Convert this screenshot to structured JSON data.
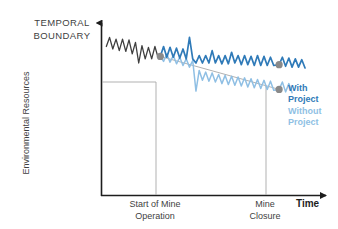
{
  "title": {
    "line1": "TEMPORAL",
    "line2": "BOUNDARY"
  },
  "axes": {
    "ylabel": "Environmental Resources",
    "xlabel": "Time",
    "xticks": [
      {
        "line1": "Start of Mine",
        "line2": "Operation"
      },
      {
        "line1": "Mine",
        "line2": "Closure"
      }
    ]
  },
  "legend": {
    "with_project": {
      "line1": "With",
      "line2": "Project"
    },
    "without_project": {
      "line1": "Without",
      "line2": "Project"
    }
  },
  "colors": {
    "baseline": "#3f3f3f",
    "with_project": "#2f7ab8",
    "without_project": "#8fbfe4",
    "marker": "#8a8a8a",
    "guide": "#a8a8a8",
    "axis": "#1d1d1d",
    "title_text": "#3f3f3f"
  },
  "chart_data": {
    "type": "line",
    "title": "TEMPORAL BOUNDARY",
    "xlabel": "Time",
    "ylabel": "Environmental Resources",
    "grid": false,
    "legend_position": "right",
    "xlim": [
      0,
      1
    ],
    "ylim": [
      0,
      1
    ],
    "annotations": [
      {
        "label": "Start of Mine Operation",
        "x": 0.27,
        "type": "vertical-marker"
      },
      {
        "label": "Mine Closure",
        "x": 0.82,
        "type": "vertical-marker"
      }
    ],
    "markers": [
      {
        "label": "Start of Mine Operation",
        "x": 0.27,
        "y": 0.84
      },
      {
        "label": "Mine Closure - With Project",
        "x": 0.82,
        "y": 0.79
      },
      {
        "label": "Mine Closure - Without Project",
        "x": 0.82,
        "y": 0.64
      }
    ],
    "series": [
      {
        "name": "Baseline (pre-project)",
        "color": "#3f3f3f",
        "points": [
          [
            0.02,
            0.9
          ],
          [
            0.035,
            0.955
          ],
          [
            0.05,
            0.885
          ],
          [
            0.065,
            0.945
          ],
          [
            0.08,
            0.875
          ],
          [
            0.095,
            0.945
          ],
          [
            0.11,
            0.87
          ],
          [
            0.125,
            0.94
          ],
          [
            0.14,
            0.855
          ],
          [
            0.155,
            0.925
          ],
          [
            0.17,
            0.8
          ],
          [
            0.185,
            0.905
          ],
          [
            0.2,
            0.825
          ],
          [
            0.215,
            0.895
          ],
          [
            0.23,
            0.825
          ],
          [
            0.245,
            0.9
          ],
          [
            0.258,
            0.84
          ],
          [
            0.27,
            0.84
          ]
        ]
      },
      {
        "name": "With Project",
        "color": "#2f7ab8",
        "points": [
          [
            0.27,
            0.84
          ],
          [
            0.285,
            0.9
          ],
          [
            0.3,
            0.835
          ],
          [
            0.315,
            0.895
          ],
          [
            0.33,
            0.835
          ],
          [
            0.345,
            0.89
          ],
          [
            0.36,
            0.83
          ],
          [
            0.375,
            0.885
          ],
          [
            0.39,
            0.825
          ],
          [
            0.405,
            0.955
          ],
          [
            0.42,
            0.825
          ],
          [
            0.435,
            0.8
          ],
          [
            0.45,
            0.845
          ],
          [
            0.465,
            0.8
          ],
          [
            0.48,
            0.845
          ],
          [
            0.495,
            0.8
          ],
          [
            0.51,
            0.875
          ],
          [
            0.525,
            0.8
          ],
          [
            0.54,
            0.845
          ],
          [
            0.555,
            0.795
          ],
          [
            0.57,
            0.845
          ],
          [
            0.585,
            0.795
          ],
          [
            0.6,
            0.865
          ],
          [
            0.615,
            0.8
          ],
          [
            0.63,
            0.845
          ],
          [
            0.645,
            0.79
          ],
          [
            0.66,
            0.845
          ],
          [
            0.675,
            0.79
          ],
          [
            0.69,
            0.84
          ],
          [
            0.705,
            0.785
          ],
          [
            0.72,
            0.845
          ],
          [
            0.735,
            0.785
          ],
          [
            0.75,
            0.84
          ],
          [
            0.765,
            0.785
          ],
          [
            0.78,
            0.835
          ],
          [
            0.795,
            0.785
          ],
          [
            0.82,
            0.79
          ],
          [
            0.835,
            0.835
          ],
          [
            0.85,
            0.78
          ],
          [
            0.865,
            0.83
          ],
          [
            0.88,
            0.775
          ],
          [
            0.895,
            0.825
          ],
          [
            0.91,
            0.775
          ],
          [
            0.925,
            0.82
          ],
          [
            0.94,
            0.77
          ]
        ]
      },
      {
        "name": "Without Project",
        "color": "#8fbfe4",
        "points": [
          [
            0.27,
            0.84
          ],
          [
            0.285,
            0.81
          ],
          [
            0.3,
            0.855
          ],
          [
            0.315,
            0.805
          ],
          [
            0.33,
            0.845
          ],
          [
            0.345,
            0.795
          ],
          [
            0.36,
            0.835
          ],
          [
            0.375,
            0.785
          ],
          [
            0.39,
            0.825
          ],
          [
            0.405,
            0.775
          ],
          [
            0.42,
            0.815
          ],
          [
            0.435,
            0.63
          ],
          [
            0.45,
            0.755
          ],
          [
            0.465,
            0.695
          ],
          [
            0.48,
            0.745
          ],
          [
            0.495,
            0.69
          ],
          [
            0.51,
            0.74
          ],
          [
            0.525,
            0.685
          ],
          [
            0.54,
            0.73
          ],
          [
            0.555,
            0.675
          ],
          [
            0.57,
            0.725
          ],
          [
            0.585,
            0.67
          ],
          [
            0.6,
            0.72
          ],
          [
            0.615,
            0.665
          ],
          [
            0.63,
            0.715
          ],
          [
            0.645,
            0.66
          ],
          [
            0.66,
            0.71
          ],
          [
            0.675,
            0.655
          ],
          [
            0.69,
            0.705
          ],
          [
            0.705,
            0.65
          ],
          [
            0.72,
            0.7
          ],
          [
            0.735,
            0.645
          ],
          [
            0.75,
            0.695
          ],
          [
            0.765,
            0.64
          ],
          [
            0.78,
            0.69
          ],
          [
            0.795,
            0.635
          ],
          [
            0.82,
            0.64
          ],
          [
            0.835,
            0.685
          ],
          [
            0.85,
            0.625
          ],
          [
            0.865,
            0.675
          ],
          [
            0.88,
            0.62
          ]
        ]
      },
      {
        "name": "Trend guide",
        "color": "#a8a8a8",
        "points": [
          [
            0.27,
            0.84
          ],
          [
            0.82,
            0.64
          ]
        ]
      }
    ]
  }
}
